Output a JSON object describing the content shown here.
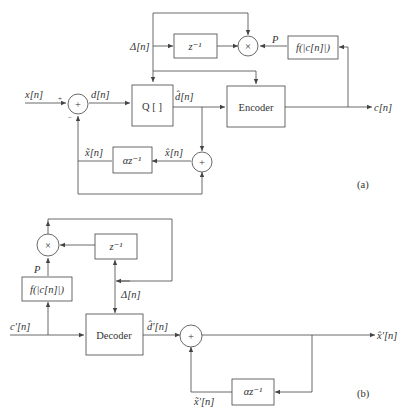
{
  "figure_a": {
    "label": "(a)",
    "inputs": {
      "x": "x[n]",
      "delta": "Δ[n]"
    },
    "output": "c[n]",
    "blocks": {
      "delay": "z⁻¹",
      "quantizer": "Q [   ]",
      "encoder": "Encoder",
      "f": "f(|c[n]|)",
      "predictor": "αz⁻¹"
    },
    "signals": {
      "d": "d[n]",
      "dhat": "d̂[n]",
      "xtilde": "x̃[n]",
      "xhat": "x̂[n]",
      "P": "P",
      "plus": "+",
      "minus": "−",
      "sum": "+",
      "mult": "×"
    }
  },
  "figure_b": {
    "label": "(b)",
    "input": "c′[n]",
    "output": "x̂′[n]",
    "blocks": {
      "delay": "z⁻¹",
      "f": "f(|c[n]|)",
      "decoder": "Decoder",
      "predictor": "αz⁻¹"
    },
    "signals": {
      "P": "P",
      "delta": "Δ[n]",
      "dhat": "d̂′[n]",
      "xtilde": "x̃′[n]",
      "sum": "+",
      "mult": "×"
    }
  }
}
